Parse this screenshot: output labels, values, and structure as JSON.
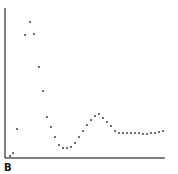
{
  "panel_label": "B",
  "colors": {
    "axis": "#555555",
    "point": "#222222",
    "background": "#ffffff"
  },
  "chart_data": {
    "type": "scatter",
    "title": "",
    "xlabel": "",
    "ylabel": "",
    "grid": false,
    "legend": null,
    "axis_pixels": {
      "x0": 5,
      "y0": 158,
      "x1": 165,
      "y1": 8
    },
    "points_px": [
      [
        10,
        156
      ],
      [
        13,
        153
      ],
      [
        17,
        129
      ],
      [
        25,
        35
      ],
      [
        30,
        22
      ],
      [
        34,
        34
      ],
      [
        39,
        67
      ],
      [
        43,
        91
      ],
      [
        47,
        117
      ],
      [
        51,
        127
      ],
      [
        55,
        137
      ],
      [
        59,
        145
      ],
      [
        63,
        148
      ],
      [
        67,
        148
      ],
      [
        71,
        147
      ],
      [
        75,
        143
      ],
      [
        79,
        137
      ],
      [
        83,
        131
      ],
      [
        87,
        125
      ],
      [
        91,
        120
      ],
      [
        95,
        116
      ],
      [
        99,
        114
      ],
      [
        103,
        118
      ],
      [
        107,
        122
      ],
      [
        111,
        126
      ],
      [
        115,
        131
      ],
      [
        119,
        133
      ],
      [
        123,
        133
      ],
      [
        127,
        133
      ],
      [
        131,
        133
      ],
      [
        135,
        133
      ],
      [
        139,
        133
      ],
      [
        143,
        134
      ],
      [
        147,
        134
      ],
      [
        151,
        133
      ],
      [
        155,
        133
      ],
      [
        159,
        132
      ],
      [
        163,
        131
      ]
    ],
    "note": "Unlabeled axes; damped oscillation — sharp peak near start, trough, smaller secondary peak, then plateau."
  }
}
